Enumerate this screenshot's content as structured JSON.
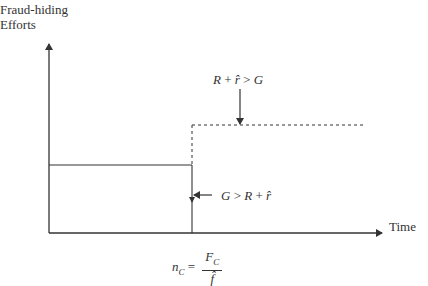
{
  "diagram": {
    "y_axis_label_line1": "Fraud-hiding",
    "y_axis_label_line2": "Efforts",
    "x_axis_label": "Time",
    "upper_condition": {
      "lhs": "R",
      "op1": "+",
      "rhat": "r̂",
      "rel": ">",
      "rhs": "G"
    },
    "lower_condition": {
      "lhs": "G",
      "rel": ">",
      "r": "R",
      "op": "+",
      "rhat": "r̂"
    },
    "threshold_formula": {
      "lhs": "n",
      "lhs_sub": "C",
      "eq": "=",
      "num": "F",
      "num_sub": "C",
      "den": "f̂"
    },
    "colors": {
      "line": "#333333",
      "text": "#333333",
      "background": "#ffffff"
    }
  }
}
